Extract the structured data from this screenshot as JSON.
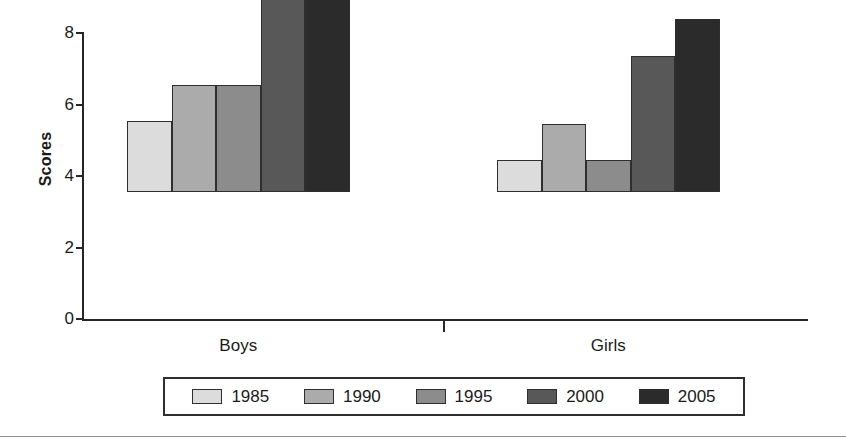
{
  "chart_data": {
    "type": "bar",
    "title": "",
    "xlabel": "",
    "ylabel": "Scores",
    "ylim": [
      0,
      8
    ],
    "yticks": [
      "0",
      "2",
      "4",
      "6",
      "8"
    ],
    "grid": false,
    "legend_position": "bottom",
    "categories": [
      "Boys",
      "Girls"
    ],
    "series": [
      {
        "name": "1985",
        "color": "#dcdcdc",
        "values": [
          2,
          0.9
        ]
      },
      {
        "name": "1990",
        "color": "#ababab",
        "values": [
          3,
          1.9
        ]
      },
      {
        "name": "1995",
        "color": "#8c8c8c",
        "values": [
          3,
          0.9
        ]
      },
      {
        "name": "2000",
        "color": "#585858",
        "values": [
          6,
          3.8
        ]
      },
      {
        "name": "2005",
        "color": "#2b2b2b",
        "values": [
          7,
          4.85
        ]
      }
    ]
  },
  "axis": {
    "y_title": "Scores",
    "y_ticks": [
      {
        "label": "8",
        "value": 8
      },
      {
        "label": "6",
        "value": 6
      },
      {
        "label": "4",
        "value": 4
      },
      {
        "label": "2",
        "value": 2
      },
      {
        "label": "0",
        "value": 0
      }
    ]
  },
  "groups": [
    {
      "label": "Boys"
    },
    {
      "label": "Girls"
    }
  ],
  "legend": {
    "entries": [
      {
        "label": "1985",
        "color": "#dcdcdc"
      },
      {
        "label": "1990",
        "color": "#ababab"
      },
      {
        "label": "1995",
        "color": "#8c8c8c"
      },
      {
        "label": "2000",
        "color": "#585858"
      },
      {
        "label": "2005",
        "color": "#2b2b2b"
      }
    ]
  },
  "colors": {
    "axis": "#262626",
    "bar_outline": "#2e2e2e",
    "background": "#ffffff"
  }
}
